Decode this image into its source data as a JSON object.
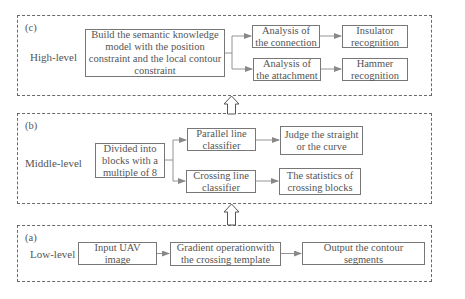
{
  "diagram": {
    "levels": {
      "high": {
        "tag": "(c)",
        "label": "High-level",
        "model_box": "Build the semantic knowledge model with the position constraint and the local contour constraint",
        "analysis_connection": "Analysis of the connection",
        "analysis_attachment": "Analysis of the attachment",
        "insulator": "Insulator recognition",
        "hammer": "Hammer recognition"
      },
      "middle": {
        "tag": "(b)",
        "label": "Middle-level",
        "divide_box": "Divided into blocks with a multiple of 8",
        "parallel_classifier": "Parallel line classifier",
        "crossing_classifier": "Crossing line classifier",
        "judge": "Judge the straight or the curve",
        "statistics": "The statistics of crossing blocks"
      },
      "low": {
        "tag": "(a)",
        "label": "Low-level",
        "input": "Input UAV image",
        "gradient": "Gradient operationwith the crossing template",
        "output": "Output the contour segments"
      }
    },
    "colors": {
      "line": "#777777",
      "arrowhead": "#888888",
      "text": "#555555",
      "dashed_border": "#6a6a6a"
    }
  }
}
